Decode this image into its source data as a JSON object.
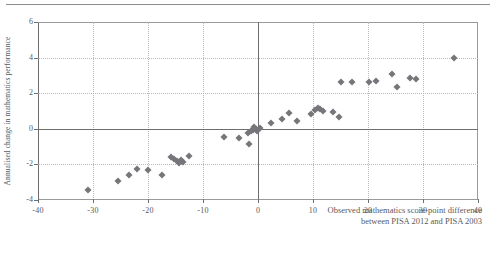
{
  "chart_data": {
    "type": "scatter",
    "title": "",
    "xlabel": "Observed mathematics score-point difference between PISA 2012 and PISA 2003",
    "xlabel_line1": "Observed mathematics score-point difference",
    "xlabel_line2": "between PISA 2012 and PISA 2003",
    "ylabel": "Annualised change in mathematics  performance",
    "xlim": [
      -40,
      40
    ],
    "ylim": [
      -4,
      6
    ],
    "xticks": [
      -40,
      -30,
      -20,
      -10,
      0,
      10,
      20,
      30,
      40
    ],
    "xtick_labels": [
      "-40",
      "-30",
      "-20",
      "-10",
      "0",
      "10",
      "20",
      "30",
      "40"
    ],
    "yticks": [
      -4,
      -2,
      0,
      2,
      4,
      6
    ],
    "ytick_labels": [
      "-4",
      "-2",
      "0",
      "2",
      "4",
      "6"
    ],
    "grid": true,
    "legend": "none",
    "marker": "diamond",
    "marker_color": "#76767a",
    "axis_color": "#6e6e70",
    "grid_color": "#b9b9bb",
    "points": [
      {
        "x": -30.9,
        "y": -3.45
      },
      {
        "x": -25.4,
        "y": -2.95
      },
      {
        "x": -23.5,
        "y": -2.6
      },
      {
        "x": -22.0,
        "y": -2.28
      },
      {
        "x": -20.0,
        "y": -2.3
      },
      {
        "x": -17.4,
        "y": -2.6
      },
      {
        "x": -15.8,
        "y": -1.6
      },
      {
        "x": -15.2,
        "y": -1.72
      },
      {
        "x": -14.8,
        "y": -1.82
      },
      {
        "x": -14.4,
        "y": -1.9
      },
      {
        "x": -14.0,
        "y": -1.75
      },
      {
        "x": -13.6,
        "y": -1.88
      },
      {
        "x": -12.6,
        "y": -1.5
      },
      {
        "x": -6.2,
        "y": -0.45
      },
      {
        "x": -3.5,
        "y": -0.5
      },
      {
        "x": -1.9,
        "y": -0.25
      },
      {
        "x": -1.3,
        "y": -0.15
      },
      {
        "x": -1.0,
        "y": -0.05
      },
      {
        "x": -0.7,
        "y": 0.1
      },
      {
        "x": -0.4,
        "y": 0.0
      },
      {
        "x": -0.2,
        "y": -0.1
      },
      {
        "x": -1.6,
        "y": -0.85
      },
      {
        "x": 0.4,
        "y": 0.05
      },
      {
        "x": 2.4,
        "y": 0.32
      },
      {
        "x": 4.4,
        "y": 0.55
      },
      {
        "x": 7.1,
        "y": 0.42
      },
      {
        "x": 5.6,
        "y": 0.9
      },
      {
        "x": 9.6,
        "y": 0.85
      },
      {
        "x": 10.4,
        "y": 1.05
      },
      {
        "x": 10.9,
        "y": 1.15
      },
      {
        "x": 11.3,
        "y": 1.1
      },
      {
        "x": 11.8,
        "y": 1.0
      },
      {
        "x": 13.6,
        "y": 0.95
      },
      {
        "x": 15.0,
        "y": 2.62
      },
      {
        "x": 14.8,
        "y": 0.65
      },
      {
        "x": 17.0,
        "y": 2.65
      },
      {
        "x": 20.2,
        "y": 2.62
      },
      {
        "x": 21.4,
        "y": 2.7
      },
      {
        "x": 24.4,
        "y": 3.1
      },
      {
        "x": 25.2,
        "y": 2.35
      },
      {
        "x": 27.6,
        "y": 2.85
      },
      {
        "x": 28.8,
        "y": 2.8
      },
      {
        "x": 35.6,
        "y": 3.95
      }
    ]
  }
}
